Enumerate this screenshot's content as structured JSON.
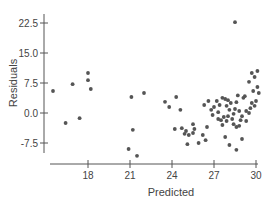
{
  "chart_data": {
    "type": "scatter",
    "title": "",
    "xlabel": "Predicted",
    "ylabel": "Residuals",
    "xlim": [
      15,
      30.3
    ],
    "ylim": [
      -11,
      24
    ],
    "x_ticks": [
      18,
      21,
      24,
      27,
      30
    ],
    "x_tick_labels": [
      "18",
      "21",
      "24",
      "27",
      "30"
    ],
    "y_ticks": [
      22.5,
      15.0,
      7.5,
      0.0,
      -7.5
    ],
    "y_tick_labels": [
      "22.5",
      "15.0",
      "7.5",
      "0.0",
      "-7.5"
    ],
    "grid": false,
    "legend": null,
    "point_color": "#555555",
    "axis_color": "#555555",
    "points": [
      [
        15.5,
        5.5
      ],
      [
        16.4,
        -2.5
      ],
      [
        16.9,
        7.2
      ],
      [
        17.4,
        -1.3
      ],
      [
        18.0,
        10.0
      ],
      [
        18.0,
        8.2
      ],
      [
        18.2,
        6.0
      ],
      [
        21.1,
        4.0
      ],
      [
        21.2,
        -4.2
      ],
      [
        20.9,
        -9.0
      ],
      [
        21.5,
        -10.7
      ],
      [
        22.0,
        5.0
      ],
      [
        23.5,
        2.8
      ],
      [
        23.8,
        1.5
      ],
      [
        24.3,
        4.0
      ],
      [
        24.6,
        0.8
      ],
      [
        24.7,
        -3.8
      ],
      [
        24.9,
        -5.2
      ],
      [
        25.0,
        -4.5
      ],
      [
        25.2,
        -5.5
      ],
      [
        25.1,
        -7.8
      ],
      [
        24.2,
        -4.0
      ],
      [
        25.5,
        -2.8
      ],
      [
        25.6,
        -4.0
      ],
      [
        25.5,
        -5.0
      ],
      [
        25.9,
        -7.5
      ],
      [
        26.2,
        -5.5
      ],
      [
        26.4,
        -6.8
      ],
      [
        26.5,
        -3.5
      ],
      [
        26.3,
        2.0
      ],
      [
        26.6,
        3.0
      ],
      [
        26.9,
        -0.5
      ],
      [
        27.2,
        3.0
      ],
      [
        27.4,
        2.0
      ],
      [
        27.3,
        0.2
      ],
      [
        27.6,
        3.8
      ],
      [
        27.8,
        3.5
      ],
      [
        27.9,
        1.8
      ],
      [
        28.0,
        3.2
      ],
      [
        28.1,
        0.8
      ],
      [
        28.2,
        2.5
      ],
      [
        28.3,
        -1.5
      ],
      [
        27.5,
        -1.8
      ],
      [
        27.7,
        -1.0
      ],
      [
        27.9,
        -2.0
      ],
      [
        27.6,
        -3.0
      ],
      [
        27.8,
        -6.0
      ],
      [
        28.4,
        -0.2
      ],
      [
        28.5,
        1.0
      ],
      [
        28.6,
        2.7
      ],
      [
        28.4,
        -2.8
      ],
      [
        28.8,
        0.5
      ],
      [
        28.9,
        -1.8
      ],
      [
        29.0,
        -0.8
      ],
      [
        29.1,
        3.8
      ],
      [
        28.7,
        4.4
      ],
      [
        29.2,
        4.2
      ],
      [
        29.3,
        -2.0
      ],
      [
        28.6,
        -3.5
      ],
      [
        29.5,
        0.0
      ],
      [
        29.6,
        1.2
      ],
      [
        29.7,
        2.5
      ],
      [
        29.9,
        1.8
      ],
      [
        30.0,
        3.0
      ],
      [
        29.8,
        5.5
      ],
      [
        30.1,
        6.5
      ],
      [
        30.2,
        5.0
      ],
      [
        29.5,
        7.8
      ],
      [
        29.7,
        10.0
      ],
      [
        29.9,
        9.0
      ],
      [
        30.1,
        10.5
      ],
      [
        28.1,
        -8.0
      ],
      [
        28.6,
        -9.2
      ],
      [
        29.0,
        -6.5
      ],
      [
        28.5,
        22.7
      ],
      [
        26.8,
        0.8
      ],
      [
        27.0,
        1.5
      ],
      [
        27.3,
        -1.5
      ],
      [
        28.8,
        -3.2
      ],
      [
        29.3,
        0.5
      ],
      [
        28.0,
        -0.8
      ]
    ]
  }
}
